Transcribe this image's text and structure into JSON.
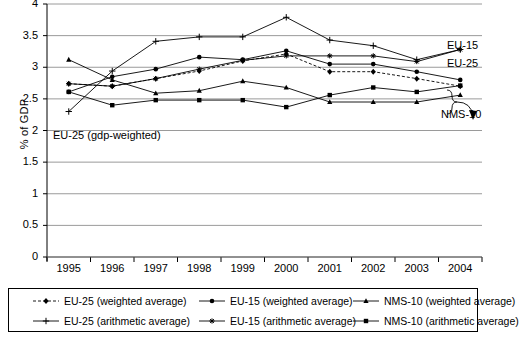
{
  "axes": {
    "ylabel": "% of GDP",
    "yticks": [
      "0",
      "0.5",
      "1",
      "1.5",
      "2",
      "2.5",
      "3",
      "3.5",
      "4"
    ],
    "xticks": [
      "1995",
      "1996",
      "1997",
      "1998",
      "1999",
      "2000",
      "2001",
      "2002",
      "2003",
      "2004"
    ]
  },
  "annotations": {
    "gdp_weighted": "EU-25 (gdp-weighted)",
    "eu15": "EU-15",
    "eu25": "EU-25",
    "nms10": "NMS-10"
  },
  "legend": {
    "items": [
      {
        "label": "EU-25 (weighted average)",
        "marker": "diamond",
        "dash": "dashed"
      },
      {
        "label": "EU-15 (weighted average)",
        "marker": "circle",
        "dash": "solid"
      },
      {
        "label": "NMS-10 (weighted average)",
        "marker": "triangle",
        "dash": "solid"
      },
      {
        "label": "EU-25 (arithmetic average)",
        "marker": "plus",
        "dash": "solid"
      },
      {
        "label": "EU-15 (arithmetic average)",
        "marker": "star",
        "dash": "solid"
      },
      {
        "label": "NMS-10 (arithmetic average)",
        "marker": "square",
        "dash": "solid"
      }
    ]
  },
  "chart_data": {
    "type": "line",
    "title": "",
    "xlabel": "",
    "ylabel": "% of GDP",
    "x": [
      "1995",
      "1996",
      "1997",
      "1998",
      "1999",
      "2000",
      "2001",
      "2002",
      "2003",
      "2004"
    ],
    "ylim": [
      0,
      4
    ],
    "ytick_step": 0.5,
    "grid": true,
    "legend_position": "bottom",
    "series": [
      {
        "name": "EU-25 (weighted average)",
        "marker": "diamond",
        "dash": "dashed",
        "values": [
          2.74,
          2.7,
          2.82,
          2.94,
          3.1,
          3.21,
          2.93,
          2.93,
          2.82,
          2.7
        ]
      },
      {
        "name": "EU-15 (weighted average)",
        "marker": "circle",
        "dash": "solid",
        "values": [
          2.61,
          2.85,
          2.97,
          3.16,
          3.12,
          3.26,
          3.05,
          3.05,
          2.93,
          2.8
        ]
      },
      {
        "name": "NMS-10 (weighted average)",
        "marker": "triangle",
        "dash": "solid",
        "values": [
          3.12,
          2.8,
          2.59,
          2.63,
          2.78,
          2.68,
          2.45,
          2.45,
          2.45,
          2.56
        ]
      },
      {
        "name": "EU-25 (arithmetic average)",
        "marker": "plus",
        "dash": "solid",
        "values": [
          2.3,
          2.94,
          3.41,
          3.48,
          3.48,
          3.79,
          3.43,
          3.34,
          3.12,
          3.28
        ]
      },
      {
        "name": "EU-15 (arithmetic average)",
        "marker": "star",
        "dash": "solid",
        "values": [
          2.74,
          2.7,
          2.82,
          2.97,
          3.11,
          3.18,
          3.18,
          3.18,
          3.09,
          3.28
        ]
      },
      {
        "name": "NMS-10 (arithmetic average)",
        "marker": "square",
        "dash": "solid",
        "values": [
          2.61,
          2.4,
          2.48,
          2.48,
          2.48,
          2.37,
          2.56,
          2.68,
          2.61,
          2.71
        ]
      }
    ]
  }
}
